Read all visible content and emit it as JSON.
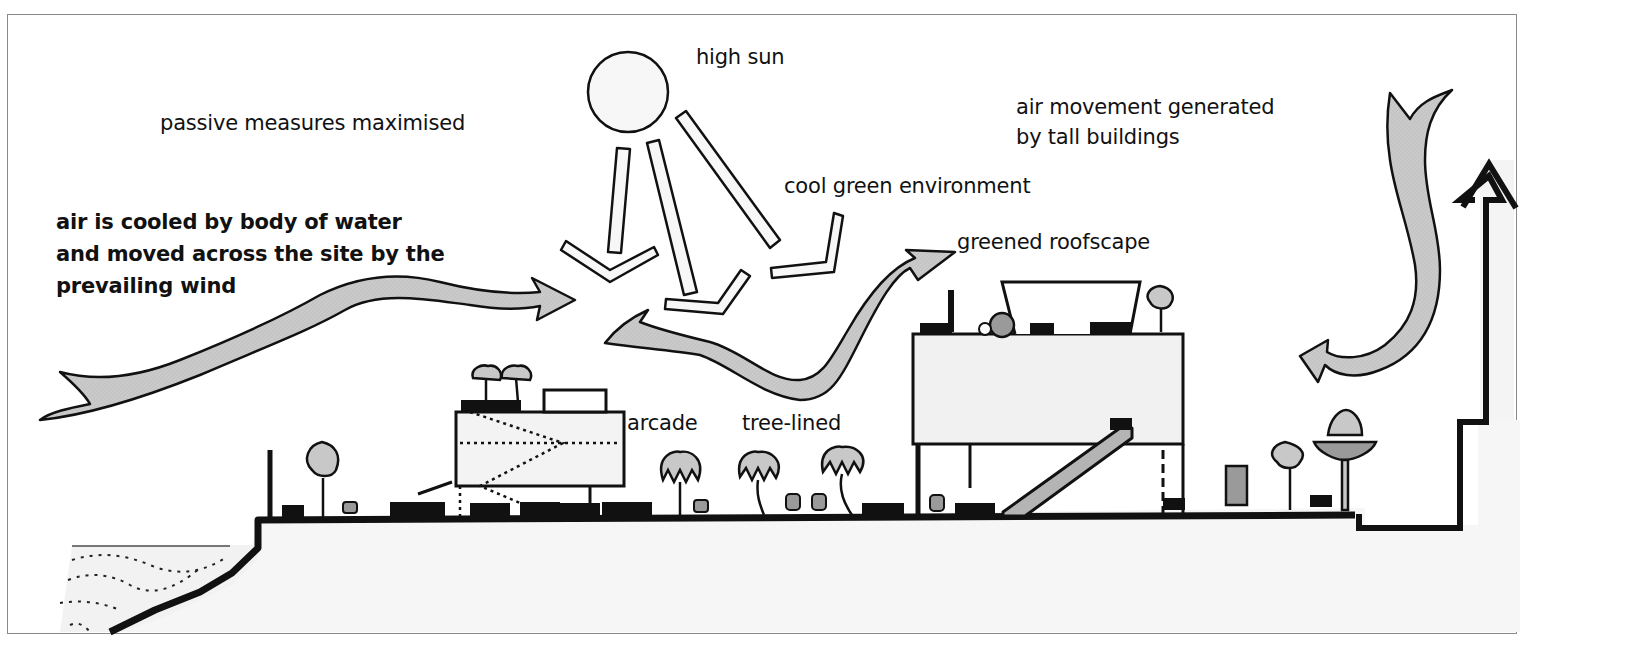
{
  "diagram": {
    "type": "architectural climate section",
    "colors": {
      "line": "#111111",
      "fill_light": "#c8c8c8",
      "fill_mid": "#9a9a9a",
      "building_fill": "#f1f1f1",
      "background": "#ffffff",
      "frame": "#8a8a8a"
    },
    "labels": {
      "high_sun": "high sun",
      "passive": "passive measures maximised",
      "cool_green": "cool green environment",
      "air_cooled": "air is cooled by body of water\nand moved across the site by the\nprevailing wind",
      "air_movement": "air movement generated\nby tall buildings",
      "greened_roofscape": "greened roofscape",
      "arcade": "arcade",
      "tree_lined": "tree-lined"
    },
    "elements": [
      "sun",
      "sun-rays",
      "reflected-rays",
      "prevailing-wind-arrow",
      "rising-air-arrow",
      "downdraft-arrow",
      "tall-building-outline-arrow",
      "water-body",
      "low-building",
      "tall-building",
      "escalator",
      "palm-trees",
      "street-trees",
      "people",
      "ground-line"
    ]
  }
}
